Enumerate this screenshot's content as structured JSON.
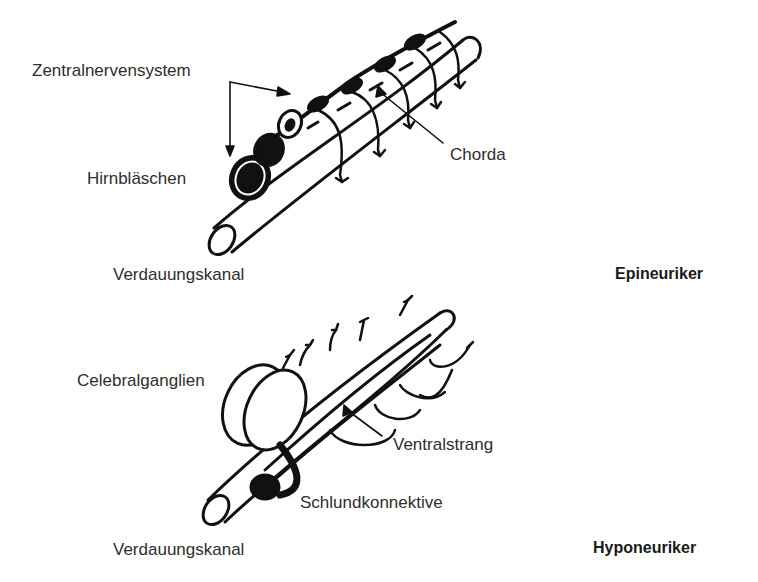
{
  "figures": [
    {
      "title": "Epineuriker",
      "labels": {
        "cns": "Zentralnervensystem",
        "brain_vesicle": "Hirnbläschen",
        "chorda": "Chorda",
        "gut": "Verdauungskanal"
      }
    },
    {
      "title": "Hyponeuriker",
      "labels": {
        "cerebral_ganglia": "Celebralganglien",
        "ventral_cord": "Ventralstrang",
        "pharyngeal_connectives": "Schlundkonnektive",
        "gut": "Verdauungskanal"
      }
    }
  ],
  "colors": {
    "ink": "#111111",
    "text": "#2e2e2e",
    "background": "#ffffff"
  }
}
